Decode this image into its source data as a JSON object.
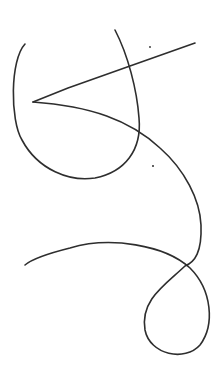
{
  "drawing": {
    "width": 223,
    "height": 376,
    "background": "#ffffff",
    "stroke_color": "#2e2e2e",
    "stroke_width": 1.6,
    "strokes": [
      {
        "name": "left-loop-stroke",
        "d": "M 25 44 C 10 60, 10 120, 22 140 C 38 170, 70 182, 95 178 C 125 172, 142 150, 139 118 C 137 90, 128 55, 115 30"
      },
      {
        "name": "straight-line-stroke",
        "d": "M 33 102 L 68 88 L 130 66 L 195 43"
      },
      {
        "name": "long-curve-stroke",
        "d": "M 33 102 C 90 106, 130 120, 160 148 C 185 170, 200 200, 201 225 C 202 252, 195 262, 185 266 C 165 285, 140 300, 145 330 C 150 355, 185 362, 200 345 C 215 325, 212 290, 190 268 C 165 245, 110 236, 70 248 C 50 253, 33 258, 25 265"
      }
    ],
    "dots": [
      {
        "name": "speck-top",
        "cx": 150,
        "cy": 47,
        "r": 0.9
      },
      {
        "name": "speck-middle",
        "cx": 153,
        "cy": 166,
        "r": 1.0
      }
    ]
  }
}
